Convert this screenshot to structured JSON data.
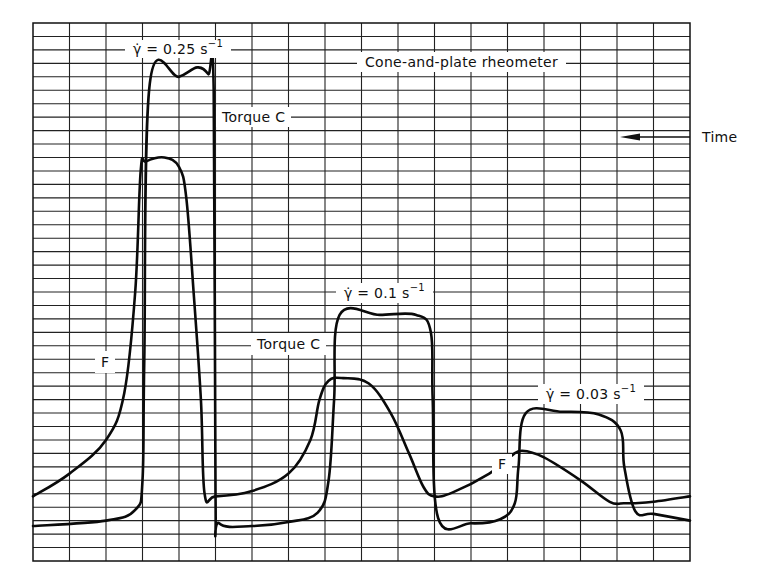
{
  "chart_data": {
    "type": "line",
    "title": "Cone-and-plate rheometer",
    "xlabel": "Time",
    "x_direction": "right-to-left (arrow points left)",
    "ylabel": "",
    "grid": true,
    "grid_columns": 18,
    "grid_rows": 40,
    "legend": [],
    "annotations": [
      {
        "text": "γ̇ = 0.25 s⁻¹",
        "shear_rate": 0.25,
        "unit": "s^-1"
      },
      {
        "text": "γ̇ = 0.1 s⁻¹",
        "shear_rate": 0.1,
        "unit": "s^-1"
      },
      {
        "text": "γ̇ = 0.03 s⁻¹",
        "shear_rate": 0.03,
        "unit": "s^-1"
      },
      {
        "text": "Torque C"
      },
      {
        "text": "Torque C"
      },
      {
        "text": "F"
      },
      {
        "text": "F"
      }
    ],
    "series": [
      {
        "name": "Torque C",
        "unit": "grid divisions from bottom (0-40)",
        "x": [
          0,
          2,
          2.8,
          3.0,
          3.05,
          3.2,
          4.0,
          4.5,
          4.8,
          4.95,
          5.0,
          5.1,
          6.0,
          7.0,
          7.8,
          8.1,
          8.25,
          8.4,
          9.5,
          10.5,
          10.9,
          10.95,
          11.1,
          12.0,
          12.8,
          13.2,
          13.3,
          13.5,
          14.5,
          15.5,
          16.1,
          16.2,
          16.5,
          17.0,
          18.0
        ],
        "values": [
          2.6,
          3.0,
          3.8,
          6,
          15,
          35.5,
          36,
          36.7,
          36.2,
          35,
          5,
          2.8,
          2.6,
          2.9,
          3.6,
          6,
          12,
          18.3,
          18.3,
          18.3,
          17,
          12,
          3.2,
          2.8,
          3.1,
          4.3,
          7,
          11,
          11.1,
          10.9,
          9.7,
          7,
          3.7,
          3.5,
          3.0
        ]
      },
      {
        "name": "F",
        "unit": "grid divisions from bottom (0-40)",
        "x": [
          0,
          1,
          2,
          2.5,
          2.8,
          2.95,
          3.1,
          3.6,
          4.0,
          4.2,
          4.4,
          4.6,
          4.7,
          5.0,
          6.0,
          7.0,
          7.6,
          7.85,
          8.1,
          8.5,
          9.2,
          9.8,
          10.3,
          10.7,
          11.0,
          11.5,
          12.5,
          13.1,
          13.4,
          14.0,
          15.0,
          15.8,
          16.2,
          16.5,
          17.0,
          18.0
        ],
        "values": [
          4.8,
          6.5,
          9,
          12.5,
          20,
          29,
          29.7,
          30,
          29.3,
          27,
          20,
          12,
          5,
          4.8,
          5.2,
          6.5,
          9,
          12,
          13.4,
          13.6,
          13.2,
          11,
          8,
          5.5,
          4.8,
          5.1,
          6.5,
          7.8,
          8.2,
          7.7,
          6,
          4.4,
          4.3,
          4.3,
          4.4,
          4.8
        ]
      }
    ],
    "ylim": [
      0,
      40
    ],
    "xlim": [
      0,
      18
    ]
  },
  "labels": {
    "title": "Cone-and-plate rheometer",
    "time": "Time",
    "rate1_prefix": "γ̇ = 0.25 s",
    "rate2_prefix": "γ̇ = 0.1 s",
    "rate3_prefix": "γ̇ = 0.03 s",
    "exponent": "−1",
    "torque1": "Torque  C",
    "torque2": "Torque  C",
    "f1": "F",
    "f2": "F"
  }
}
